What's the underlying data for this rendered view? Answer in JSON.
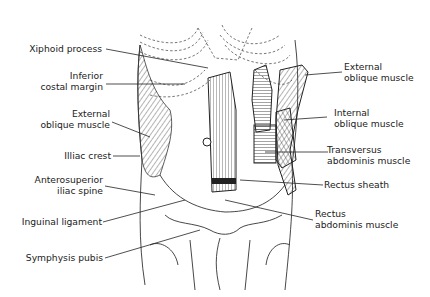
{
  "diagram": {
    "labels_left": [
      {
        "id": "xiphoid",
        "lines": [
          "Xiphoid process"
        ]
      },
      {
        "id": "costal",
        "lines": [
          "Inferior",
          "costal margin"
        ]
      },
      {
        "id": "ext_oblique_left",
        "lines": [
          "External",
          "oblique muscle"
        ]
      },
      {
        "id": "iliac_crest",
        "lines": [
          "Illiac crest"
        ]
      },
      {
        "id": "asis",
        "lines": [
          "Anterosuperior",
          "iliac spine"
        ]
      },
      {
        "id": "inguinal",
        "lines": [
          "Inguinal ligament"
        ]
      },
      {
        "id": "symphysis",
        "lines": [
          "Symphysis pubis"
        ]
      }
    ],
    "labels_right": [
      {
        "id": "ext_oblique_right",
        "lines": [
          "External",
          "oblique muscle"
        ]
      },
      {
        "id": "int_oblique",
        "lines": [
          "Internal",
          "oblique muscle"
        ]
      },
      {
        "id": "transversus",
        "lines": [
          "Transversus",
          "abdominis muscle"
        ]
      },
      {
        "id": "rectus_sheath",
        "lines": [
          "Rectus sheath"
        ]
      },
      {
        "id": "rectus_abdominis",
        "lines": [
          "Rectus",
          "abdominis muscle"
        ]
      }
    ]
  }
}
